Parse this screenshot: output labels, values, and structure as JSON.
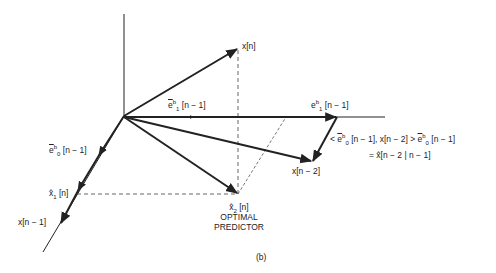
{
  "figure": {
    "caption": "(b)",
    "labels": {
      "x_n": "x[n]",
      "e1b_bar": {
        "base": "e",
        "sup": "b",
        "sub": "1",
        "arg": "[n − 1]"
      },
      "e1b": {
        "base": "e",
        "sup": "b",
        "sub": "1",
        "arg": "[n − 1]"
      },
      "e0b_bar": {
        "base": "e",
        "sup": "b",
        "sub": "0",
        "arg": "[n − 1]"
      },
      "x1hat": {
        "base": "x̂",
        "sub": "1",
        "arg": "[n]"
      },
      "x2hat": {
        "base": "x̂",
        "sub": "2",
        "arg": "[n]"
      },
      "x_n_minus_1": "x[n − 1]",
      "x_n_minus_2": "x[n − 2]",
      "optimal": "OPTIMAL",
      "predictor": "PREDICTOR",
      "inner_product_line1_open": "< ",
      "inner_product_line1_mid": "[n − 1], x[n − 2] > ",
      "inner_product_line1_end": "[n − 1]",
      "inner_product_line2": "= x̂[n − 2 | n − 1]"
    },
    "stroke_color": "#222222",
    "dash_color": "#555555"
  }
}
